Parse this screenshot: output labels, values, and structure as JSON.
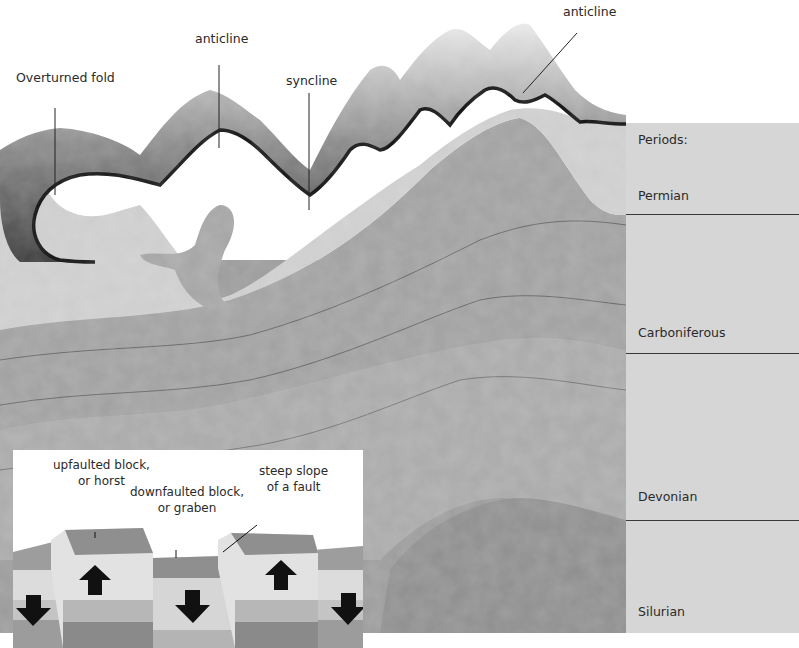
{
  "diagram": {
    "title_labels": {
      "overturned_fold": "Overturned fold",
      "anticline_left": "anticline",
      "syncline": "syncline",
      "anticline_right": "anticline"
    },
    "periods": {
      "heading": "Periods:",
      "items": [
        {
          "name": "Permian"
        },
        {
          "name": "Carboniferous"
        },
        {
          "name": "Devonian"
        },
        {
          "name": "Silurian"
        }
      ]
    },
    "inset": {
      "horst_line1": "upfaulted block,",
      "horst_line2": "or horst",
      "graben_line1": "downfaulted block,",
      "graben_line2": "or graben",
      "fault_line1": "steep slope",
      "fault_line2": "of a fault"
    },
    "colors": {
      "background": "#ffffff",
      "periods_panel": "#d6d6d6",
      "permian_rock": "#c9c9c9",
      "carboniferous_rock": "#9e9e9e",
      "devonian_rock": "#a8a8a8",
      "silurian_rock": "#8c8c8c",
      "mountain_dark": "#3c3c3c",
      "arrow": "#111111"
    }
  }
}
